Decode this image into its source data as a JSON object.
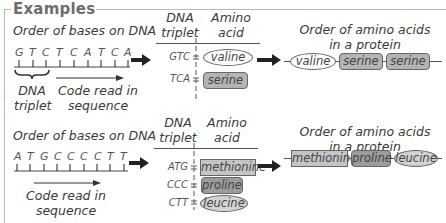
{
  "title": "Examples",
  "example1": {
    "dna_label": "Order of bases on DNA",
    "bases": [
      "G",
      "T",
      "C",
      "T",
      "C",
      "A",
      "T",
      "C",
      "A"
    ],
    "triplet_label_line1": "DNA",
    "triplet_label_line2": "triplet",
    "sequence_label_line1": "Code read in",
    "sequence_label_line2": "sequence",
    "table": {
      "col1_line1": "DNA",
      "col1_line2": "triplet",
      "col2_line1": "Amino",
      "col2_line2": "acid",
      "rows": [
        {
          "codon": "GTC",
          "amino_acid": "valine",
          "shape": "oval"
        },
        {
          "codon": "TCA",
          "amino_acid": "serine",
          "shape": "rounded-rect"
        }
      ]
    },
    "protein_label_line1": "Order of amino acids",
    "protein_label_line2": "in a protein",
    "protein": [
      "valine",
      "serine",
      "serine"
    ]
  },
  "example2": {
    "dna_label": "Order of bases on DNA",
    "bases": [
      "A",
      "T",
      "G",
      "C",
      "C",
      "C",
      "C",
      "T",
      "T"
    ],
    "sequence_label_line1": "Code read in",
    "sequence_label_line2": "sequence",
    "table": {
      "col1_line1": "DNA",
      "col1_line2": "triplet",
      "col2_line1": "Amino",
      "col2_line2": "acid",
      "rows": [
        {
          "codon": "ATG",
          "amino_acid": "methionine",
          "shape": "rectangle"
        },
        {
          "codon": "CCC",
          "amino_acid": "proline",
          "shape": "rounded-rect-dark"
        },
        {
          "codon": "CTT",
          "amino_acid": "leucine",
          "shape": "oval-grey"
        }
      ]
    },
    "protein_label_line1": "Order of amino acids",
    "protein_label_line2": "in a protein",
    "protein": [
      "methionine",
      "proline",
      "leucine"
    ]
  },
  "colors": {
    "frame": "#b9b9b9",
    "title": "#6d6d6d",
    "serine_fill": "#b4b4b4",
    "methionine_fill": "#c4c4c4",
    "proline_fill": "#9c9c9c",
    "leucine_fill": "#d3d3d3",
    "valine_fill": "#ffffff"
  }
}
